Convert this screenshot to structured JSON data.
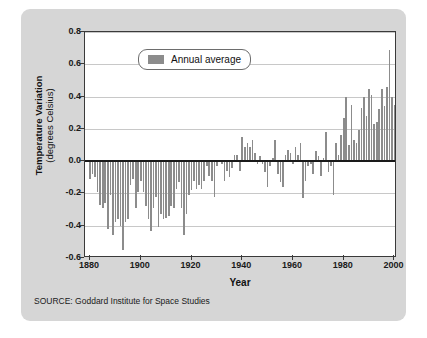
{
  "chart_data": {
    "type": "bar",
    "title": "",
    "xlabel": "Year",
    "ylabel_main": "Temperature Variation",
    "ylabel_sub": "(degrees Celsius)",
    "series_name": "Annual average",
    "source": "SOURCE: Goddard Institute for Space Studies",
    "xlim": [
      1878,
      2001
    ],
    "ylim": [
      -0.6,
      0.8
    ],
    "ytick_values": [
      0.8,
      0.6,
      0.4,
      0.2,
      0.0,
      -0.2,
      -0.4,
      -0.6
    ],
    "ytick_labels": [
      "0.8",
      "0.6",
      "0.4",
      "0.2",
      "0.0",
      "-0.2",
      "-0.4",
      "-0.6"
    ],
    "xtick_values": [
      1880,
      1900,
      1920,
      1940,
      1960,
      1980,
      2000
    ],
    "xtick_labels": [
      "1880",
      "1900",
      "1920",
      "1940",
      "1960",
      "1980",
      "2000"
    ],
    "grid": true,
    "grid_axis": "y",
    "legend_position": "upper-left-inside",
    "zero_line": true,
    "bar_color": "#8c8c8c",
    "grid_color": "#c8c8c8",
    "axis_color": "#3a3a3a",
    "plot_background": "#ffffff",
    "card_background": "#d6d6d6",
    "x": [
      1880,
      1881,
      1882,
      1883,
      1884,
      1885,
      1886,
      1887,
      1888,
      1889,
      1890,
      1891,
      1892,
      1893,
      1894,
      1895,
      1896,
      1897,
      1898,
      1899,
      1900,
      1901,
      1902,
      1903,
      1904,
      1905,
      1906,
      1907,
      1908,
      1909,
      1910,
      1911,
      1912,
      1913,
      1914,
      1915,
      1916,
      1917,
      1918,
      1919,
      1920,
      1921,
      1922,
      1923,
      1924,
      1925,
      1926,
      1927,
      1928,
      1929,
      1930,
      1931,
      1932,
      1933,
      1934,
      1935,
      1936,
      1937,
      1938,
      1939,
      1940,
      1941,
      1942,
      1943,
      1944,
      1945,
      1946,
      1947,
      1948,
      1949,
      1950,
      1951,
      1952,
      1953,
      1954,
      1955,
      1956,
      1957,
      1958,
      1959,
      1960,
      1961,
      1962,
      1963,
      1964,
      1965,
      1966,
      1967,
      1968,
      1969,
      1970,
      1971,
      1972,
      1973,
      1974,
      1975,
      1976,
      1977,
      1978,
      1979,
      1980,
      1981,
      1982,
      1983,
      1984,
      1985,
      1986,
      1987,
      1988,
      1989,
      1990,
      1991,
      1992,
      1993,
      1994,
      1995,
      1996,
      1997,
      1998,
      1999,
      2000
    ],
    "values": [
      -0.11,
      -0.08,
      -0.1,
      -0.19,
      -0.27,
      -0.29,
      -0.26,
      -0.42,
      -0.21,
      -0.46,
      -0.38,
      -0.36,
      -0.4,
      -0.55,
      -0.38,
      -0.36,
      -0.15,
      -0.11,
      -0.29,
      -0.19,
      -0.12,
      -0.19,
      -0.28,
      -0.36,
      -0.43,
      -0.29,
      -0.22,
      -0.41,
      -0.33,
      -0.36,
      -0.35,
      -0.34,
      -0.28,
      -0.29,
      -0.17,
      -0.13,
      -0.29,
      -0.46,
      -0.33,
      -0.21,
      -0.18,
      -0.12,
      -0.17,
      -0.15,
      -0.17,
      -0.12,
      -0.03,
      -0.09,
      -0.12,
      -0.22,
      -0.03,
      0.0,
      -0.02,
      -0.12,
      -0.06,
      -0.1,
      -0.04,
      0.04,
      0.04,
      -0.06,
      0.15,
      0.09,
      0.11,
      0.09,
      0.13,
      0.05,
      -0.02,
      0.03,
      -0.02,
      -0.07,
      -0.16,
      -0.03,
      0.02,
      0.13,
      -0.08,
      -0.13,
      -0.16,
      0.04,
      0.07,
      0.05,
      -0.02,
      0.09,
      0.04,
      0.11,
      -0.23,
      -0.12,
      -0.03,
      -0.02,
      -0.08,
      0.06,
      0.03,
      -0.09,
      0.02,
      0.18,
      -0.07,
      -0.03,
      -0.21,
      0.11,
      0.04,
      0.16,
      0.27,
      0.4,
      0.1,
      0.35,
      0.13,
      0.11,
      0.19,
      0.33,
      0.4,
      0.28,
      0.45,
      0.41,
      0.23,
      0.24,
      0.32,
      0.45,
      0.34,
      0.46,
      0.69,
      0.4,
      0.35
    ]
  }
}
